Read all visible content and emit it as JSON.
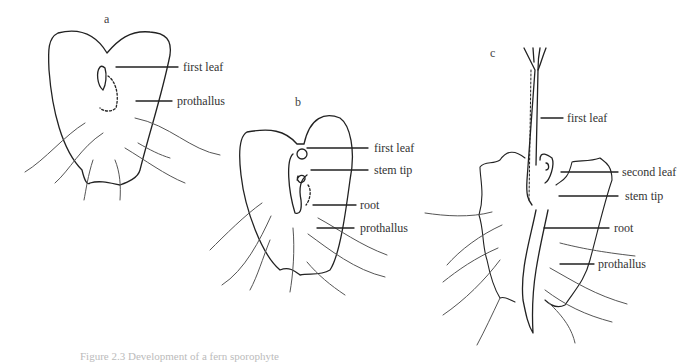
{
  "figure": {
    "panels": [
      {
        "id": "a",
        "letter": "a",
        "labels": [
          "first leaf",
          "prothallus"
        ]
      },
      {
        "id": "b",
        "letter": "b",
        "labels": [
          "first leaf",
          "stem tip",
          "root",
          "prothallus"
        ]
      },
      {
        "id": "c",
        "letter": "c",
        "labels": [
          "first leaf",
          "second leaf",
          "stem tip",
          "root",
          "prothallus"
        ]
      }
    ],
    "caption": "Figure 2.3  Development of a fern sporophyte"
  }
}
